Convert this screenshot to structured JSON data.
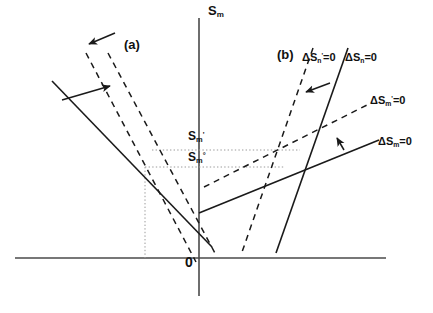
{
  "figure": {
    "type": "line-diagram",
    "width": 433,
    "height": 313,
    "background": "#ffffff",
    "ink_color": "#1a1a1a"
  },
  "axes": {
    "y_axis_label": "S",
    "y_axis_sub": "m",
    "origin_label": "0",
    "x_axis": {
      "x1": 15,
      "y1": 258,
      "x2": 386,
      "y2": 258
    },
    "y_axis": {
      "x1": 199,
      "y1": 18,
      "x2": 199,
      "y2": 296
    }
  },
  "panels": [
    {
      "name": "panel-a",
      "label": "(a)",
      "x": 124,
      "y": 38
    },
    {
      "name": "panel-b",
      "label": "(b)",
      "x": 277,
      "y": 48
    }
  ],
  "levels": [
    {
      "name": "s-m-prime",
      "base": "S",
      "sub": "m",
      "sup": "'",
      "x": 188,
      "y": 130,
      "guide_y": 150
    },
    {
      "name": "s-m-zero",
      "base": "S",
      "sub": "m",
      "sup": "°",
      "x": 188,
      "y": 151,
      "guide_y": 167
    }
  ],
  "curve_labels": [
    {
      "name": "delta-sn-prime-zero",
      "text": "ΔS",
      "sub": "n",
      "sup": "'",
      "tail": "=0",
      "x": 302,
      "y": 52
    },
    {
      "name": "delta-sn-zero",
      "text": "ΔS",
      "sub": "n",
      "sup": "",
      "tail": "=0",
      "x": 345,
      "y": 52
    },
    {
      "name": "delta-sm-prime-zero",
      "text": "ΔS",
      "sub": "m",
      "sup": "'",
      "tail": "=0",
      "x": 370,
      "y": 95
    },
    {
      "name": "delta-sm-zero",
      "text": "ΔS",
      "sub": "m",
      "sup": "",
      "tail": "=0",
      "x": 378,
      "y": 136
    }
  ],
  "lines": {
    "panel_a_solid": {
      "name": "line-a-solid",
      "style": "solid",
      "x1": 52,
      "y1": 81,
      "x2": 212,
      "y2": 247
    },
    "panel_a_dashed_left": {
      "name": "line-a-dashed-left",
      "style": "dashed",
      "x1": 86,
      "y1": 53,
      "x2": 196,
      "y2": 262
    },
    "panel_a_dashed_right": {
      "name": "line-a-dashed-right",
      "style": "dashed",
      "x1": 108,
      "y1": 53,
      "x2": 216,
      "y2": 255
    },
    "panel_b_dashed_steep": {
      "name": "line-b-dashed-steep",
      "style": "dashed",
      "x1": 313,
      "y1": 48,
      "x2": 241,
      "y2": 255
    },
    "panel_b_solid_steep": {
      "name": "line-b-solid-steep",
      "style": "solid",
      "x1": 348,
      "y1": 48,
      "x2": 276,
      "y2": 253
    },
    "panel_b_dashed_flat": {
      "name": "line-b-dashed-flat",
      "style": "dashed",
      "x1": 204,
      "y1": 187,
      "x2": 371,
      "y2": 103
    },
    "panel_b_solid_flat": {
      "name": "line-b-solid-flat",
      "style": "solid",
      "x1": 199,
      "y1": 213,
      "x2": 379,
      "y2": 140
    }
  },
  "guides": [
    {
      "name": "guide-upper-horizontal",
      "orient": "h",
      "x1": 152,
      "y1": 150,
      "x2": 300,
      "y2": 150
    },
    {
      "name": "guide-lower-horizontal",
      "orient": "h",
      "x1": 145,
      "y1": 167,
      "x2": 285,
      "y2": 167
    },
    {
      "name": "guide-vertical-drop",
      "orient": "v",
      "x1": 145,
      "y1": 167,
      "x2": 145,
      "y2": 258
    }
  ],
  "arrows": [
    {
      "name": "arrow-a-upper",
      "x1": 115,
      "y1": 33,
      "x2": 89,
      "y2": 44
    },
    {
      "name": "arrow-a-lower",
      "x1": 62,
      "y1": 100,
      "x2": 110,
      "y2": 86
    },
    {
      "name": "arrow-b-upper",
      "x1": 330,
      "y1": 83,
      "x2": 306,
      "y2": 92
    },
    {
      "name": "arrow-b-lower",
      "x1": 344,
      "y1": 150,
      "x2": 337,
      "y2": 138
    }
  ]
}
